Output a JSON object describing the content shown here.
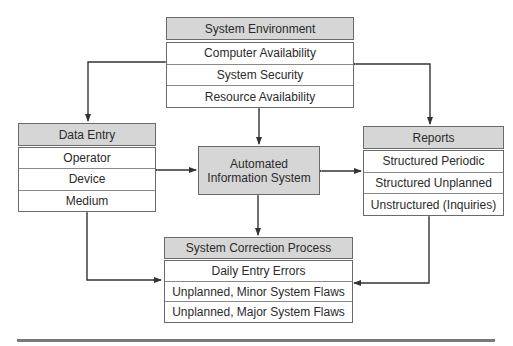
{
  "diagram": {
    "center": {
      "line1": "Automated",
      "line2": "Information System"
    },
    "system_environment": {
      "title": "System Environment",
      "items": [
        "Computer Availability",
        "System Security",
        "Resource Availability"
      ]
    },
    "data_entry": {
      "title": "Data Entry",
      "items": [
        "Operator",
        "Device",
        "Medium"
      ]
    },
    "reports": {
      "title": "Reports",
      "items": [
        "Structured Periodic",
        "Structured Unplanned",
        "Unstructured (Inquiries)"
      ]
    },
    "system_correction": {
      "title": "System Correction Process",
      "items": [
        "Daily Entry Errors",
        "Unplanned, Minor System Flaws",
        "Unplanned, Major System Flaws"
      ]
    },
    "colors": {
      "header_fill": "#d6d6d6",
      "border": "#6a6a6a",
      "arrow": "#333333"
    }
  }
}
